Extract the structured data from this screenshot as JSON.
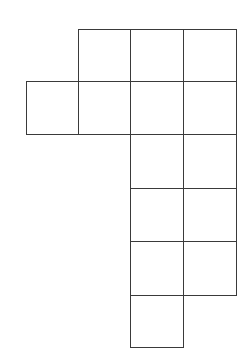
{
  "diagram": {
    "type": "grid-net",
    "line_color": "#3a3a3a",
    "background": "#ffffff",
    "cell_size_px": 53,
    "col_edges_px": [
      26,
      78,
      130,
      183,
      236
    ],
    "row_edges_px": [
      29,
      81,
      134,
      188,
      241,
      295,
      347
    ],
    "cells": [
      {
        "row": 0,
        "col": 1
      },
      {
        "row": 0,
        "col": 2
      },
      {
        "row": 0,
        "col": 3
      },
      {
        "row": 1,
        "col": 0
      },
      {
        "row": 1,
        "col": 1
      },
      {
        "row": 1,
        "col": 2
      },
      {
        "row": 1,
        "col": 3
      },
      {
        "row": 2,
        "col": 2
      },
      {
        "row": 2,
        "col": 3
      },
      {
        "row": 3,
        "col": 2
      },
      {
        "row": 3,
        "col": 3
      },
      {
        "row": 4,
        "col": 2
      },
      {
        "row": 4,
        "col": 3
      },
      {
        "row": 5,
        "col": 2
      }
    ]
  }
}
